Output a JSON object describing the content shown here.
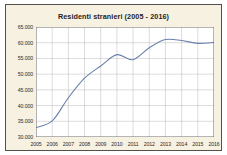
{
  "figure": {
    "panel_background": "#f7f1e2",
    "frame_color": "#55514a",
    "page_background": "#ffffff"
  },
  "chart_data": {
    "type": "line",
    "title": "Residenti stranieri (2005 - 2016)",
    "subtitle": "",
    "xlabel": "",
    "ylabel": "",
    "x": [
      2005,
      2006,
      2007,
      2008,
      2009,
      2010,
      2011,
      2012,
      2013,
      2014,
      2015,
      2016
    ],
    "categories": [
      "2005",
      "2006",
      "2007",
      "2008",
      "2009",
      "2010",
      "2011",
      "2012",
      "2013",
      "2014",
      "2015",
      "2016"
    ],
    "values": [
      33000,
      35100,
      42500,
      48700,
      52600,
      56200,
      54600,
      58400,
      61000,
      60700,
      59800,
      60100
    ],
    "series": [
      {
        "name": "Residenti stranieri",
        "color": "#6b80ab",
        "values": [
          33000,
          35100,
          42500,
          48700,
          52600,
          56200,
          54600,
          58400,
          61000,
          60700,
          59800,
          60100
        ]
      }
    ],
    "ylim": [
      30000,
      65000
    ],
    "ytick_values": [
      30000,
      35000,
      40000,
      45000,
      50000,
      55000,
      60000,
      65000
    ],
    "ytick_labels": [
      "30.000",
      "35.000",
      "40.000",
      "45.000",
      "50.000",
      "55.000",
      "60.000",
      "65.000"
    ],
    "xtick_labels": [
      "2005",
      "2006",
      "2007",
      "2008",
      "2009",
      "2010",
      "2011",
      "2012",
      "2013",
      "2014",
      "2015",
      "2016"
    ],
    "grid": true,
    "grid_color": "#b9b9b9",
    "legend": false,
    "legend_position": "none",
    "line_color": "#6b80ab",
    "line_width": 1.1,
    "markers": false,
    "plot_background": "#ffffff",
    "annotations": []
  }
}
